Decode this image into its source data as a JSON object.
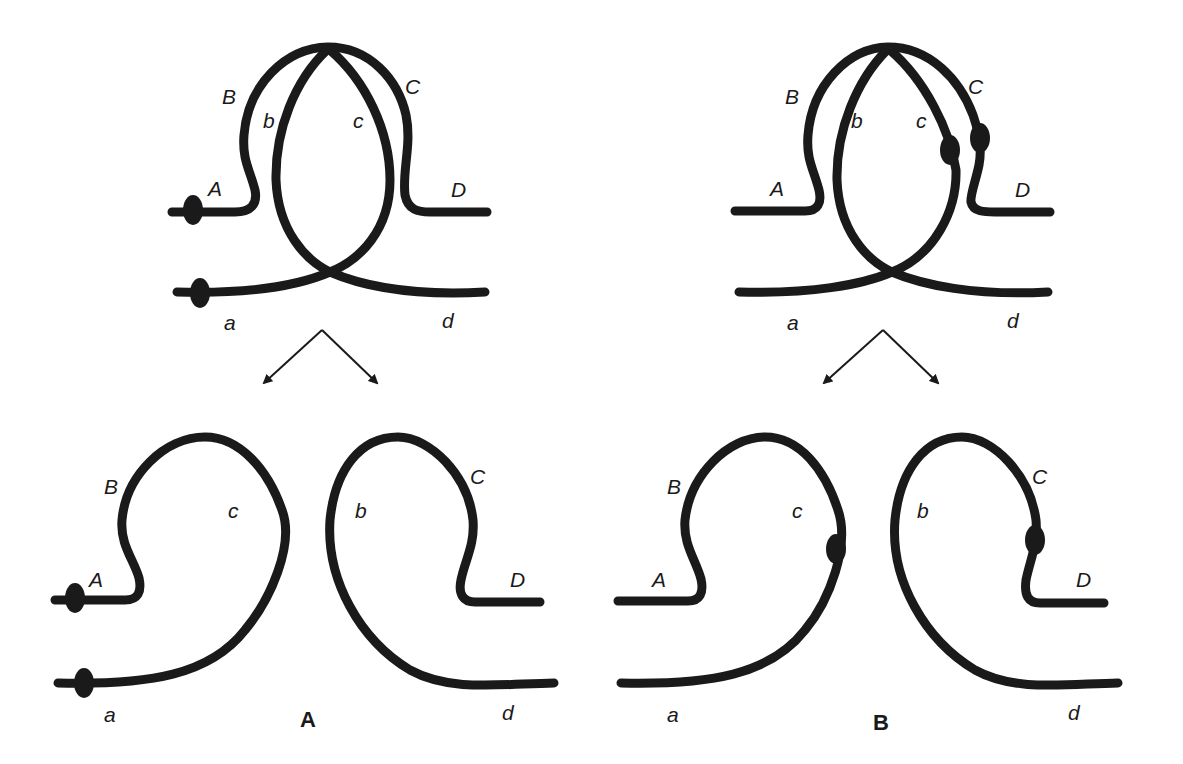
{
  "figure": {
    "panels": [
      {
        "id": "A",
        "label": "A",
        "top": {
          "strand_labels": {
            "A": "A",
            "B": "B",
            "C": "C",
            "D": "D",
            "a": "a",
            "b": "b",
            "c": "c",
            "d": "d"
          },
          "beads": [
            "on strand A (left end)",
            "on strand a (left end)"
          ]
        },
        "bottom_left": {
          "strand_labels": {
            "B": "B",
            "A": "A",
            "c": "c",
            "a": "a"
          },
          "beads": [
            "on A",
            "on a"
          ]
        },
        "bottom_right": {
          "strand_labels": {
            "b": "b",
            "C": "C",
            "D": "D",
            "d": "d"
          },
          "beads": []
        }
      },
      {
        "id": "B",
        "label": "B",
        "top": {
          "strand_labels": {
            "A": "A",
            "B": "B",
            "C": "C",
            "D": "D",
            "a": "a",
            "b": "b",
            "c": "c",
            "d": "d"
          },
          "beads": [
            "on strand c",
            "on strand C"
          ]
        },
        "bottom_left": {
          "strand_labels": {
            "B": "B",
            "A": "A",
            "c": "c",
            "a": "a"
          },
          "beads": [
            "on c"
          ]
        },
        "bottom_right": {
          "strand_labels": {
            "b": "b",
            "C": "C",
            "D": "D",
            "d": "d"
          },
          "beads": [
            "on C"
          ]
        }
      }
    ],
    "colors": {
      "ink": "#1a1a1a",
      "background": "#ffffff"
    }
  }
}
